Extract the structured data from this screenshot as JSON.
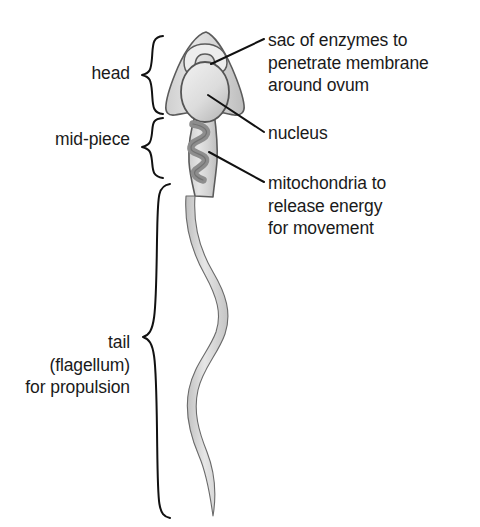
{
  "figure": {
    "background_color": "#ffffff",
    "text_color": "#1a1a1a",
    "line_color": "#111111",
    "cell_fill_color": "#d9d9d9",
    "cell_outline_color": "#555555",
    "organelle_color": "#8a8a8a"
  },
  "left_labels": {
    "head": "head",
    "midpiece": "mid-piece",
    "tail": "tail\n(flagellum)\nfor propulsion"
  },
  "right_labels": {
    "acrosome": "sac of enzymes to\npenetrate membrane\naround ovum",
    "nucleus": "nucleus",
    "mitochondria": "mitochondria to\nrelease energy\nfor movement"
  },
  "parts": [
    {
      "name": "head",
      "brace_top": 35,
      "brace_bottom": 115
    },
    {
      "name": "mid-piece",
      "brace_top": 116,
      "brace_bottom": 180
    },
    {
      "name": "tail",
      "brace_top": 182,
      "brace_bottom": 519
    }
  ],
  "callouts": [
    {
      "name": "acrosome",
      "target_x": 212,
      "target_y": 63,
      "text_x": 264,
      "text_y": 39
    },
    {
      "name": "nucleus",
      "target_x": 210,
      "target_y": 96,
      "text_x": 264,
      "text_y": 132
    },
    {
      "name": "mitochondria",
      "target_x": 211,
      "target_y": 152,
      "text_x": 264,
      "text_y": 182
    }
  ]
}
